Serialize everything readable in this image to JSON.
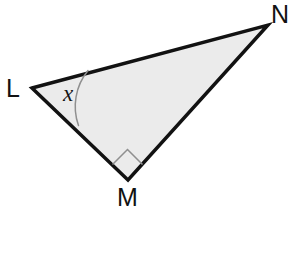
{
  "figure": {
    "kind": "geometry-diagram",
    "shape": "triangle",
    "canvas": {
      "width": 292,
      "height": 256
    },
    "background_color": "#ffffff",
    "fill_color": "#ebebeb",
    "stroke_color": "#121212",
    "stroke_width": 3.4,
    "marker_stroke_color": "#8f8f8f",
    "marker_stroke_width": 1.5
  },
  "vertices": [
    {
      "id": "L",
      "label": "L",
      "x": 32,
      "y": 88,
      "label_x": 6,
      "label_y": 97
    },
    {
      "id": "M",
      "label": "M",
      "x": 128,
      "y": 180,
      "label_x": 117,
      "label_y": 206
    },
    {
      "id": "N",
      "label": "N",
      "x": 268,
      "y": 25,
      "label_x": 271,
      "label_y": 23
    }
  ],
  "polygon": {
    "points": "32,88 268,25 128,180",
    "sides": [
      {
        "from": "L",
        "to": "N"
      },
      {
        "from": "N",
        "to": "M"
      },
      {
        "from": "M",
        "to": "L"
      }
    ]
  },
  "angle_markers": [
    {
      "id": "angle-x",
      "at_vertex": "L",
      "type": "arc",
      "label": "x",
      "label_x": 68,
      "label_y": 101,
      "arc_path": "M 88,70.5 A 57,57 0 0 0 78.5,125.5"
    },
    {
      "id": "right-angle-m",
      "at_vertex": "M",
      "type": "square",
      "label": "",
      "square_path": "M 112.5,164.5 L 127.5,149.5 L 142.5,164.5"
    }
  ],
  "colors": {
    "outline": "#121212",
    "interior": "#ebebeb",
    "marker": "#8f8f8f",
    "text": "#121212",
    "page": "#ffffff"
  }
}
